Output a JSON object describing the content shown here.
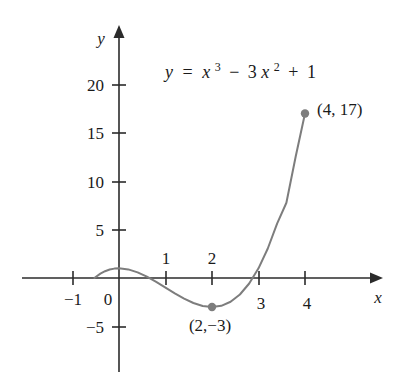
{
  "figure": {
    "title_equation_plain": "y = x^3 - 3x^2 + 1",
    "background_color": "#ffffff",
    "axis_color": "#2b2b2b",
    "curve_color": "#7d7d7d",
    "text_color": "#1a1a1a"
  },
  "equation": {
    "lhs": "y",
    "equals": "=",
    "term1_base": "x",
    "term1_exp": "3",
    "minus": "−",
    "term2_coeff": "3",
    "term2_base": "x",
    "term2_exp": "2",
    "plus": "+",
    "constant": "1"
  },
  "axes": {
    "x_label": "x",
    "y_label": "y",
    "x_ticks_labeled": [
      "−1",
      "1",
      "2",
      "3",
      "4"
    ],
    "y_ticks_labeled": [
      "−5",
      "5",
      "10",
      "15",
      "20"
    ],
    "origin_label": "0",
    "x_tick_values": [
      -1,
      1,
      2,
      3,
      4
    ],
    "y_tick_values": [
      -5,
      5,
      10,
      15,
      20
    ],
    "x_label_above_axis": [
      "1",
      "2"
    ],
    "x_label_below_axis": [
      "−1",
      "3",
      "4"
    ],
    "xlim": [
      -1.6,
      5.2
    ],
    "ylim": [
      -10.5,
      24.0
    ]
  },
  "annotations": [
    {
      "name": "local-min-point",
      "text": "(2,−3)",
      "x": 2,
      "y": -3,
      "position": "below"
    },
    {
      "name": "endpoint-point",
      "text": "(4, 17)",
      "x": 4,
      "y": 17,
      "position": "right"
    }
  ],
  "chart_data": {
    "type": "line",
    "xlabel": "x",
    "ylabel": "y",
    "function": "y = x^3 - 3x^2 + 1",
    "grid": false,
    "legend": "none",
    "xlim": [
      -1.6,
      5.2
    ],
    "ylim": [
      -10.5,
      24.0
    ],
    "xticks": [
      -1,
      0,
      1,
      2,
      3,
      4
    ],
    "yticks": [
      -5,
      0,
      5,
      10,
      15,
      20
    ],
    "domain_drawn": [
      -0.53,
      4.0
    ],
    "series": [
      {
        "name": "y = x^3 - 3x^2 + 1",
        "color": "#7d7d7d",
        "x": [
          -0.53,
          -0.4,
          -0.3,
          -0.2,
          -0.1,
          0.0,
          0.2,
          0.4,
          0.6,
          0.8,
          1.0,
          1.2,
          1.4,
          1.6,
          1.8,
          2.0,
          2.2,
          2.4,
          2.6,
          2.8,
          3.0,
          3.2,
          3.4,
          3.6,
          3.8,
          4.0
        ],
        "y": [
          0.0,
          0.456,
          0.703,
          0.872,
          0.969,
          1.0,
          0.888,
          0.584,
          0.136,
          -0.408,
          -1.0,
          -1.592,
          -2.136,
          -2.584,
          -2.888,
          -3.0,
          -2.872,
          -2.456,
          -1.704,
          -0.568,
          1.0,
          3.048,
          5.624,
          7.776,
          12.544,
          17.0
        ]
      }
    ],
    "marked_points": [
      {
        "label": "(2,−3)",
        "x": 2,
        "y": -3
      },
      {
        "label": "(4, 17)",
        "x": 4,
        "y": 17
      }
    ]
  }
}
